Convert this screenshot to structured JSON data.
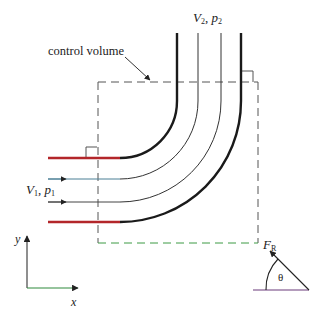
{
  "figure": {
    "labels": {
      "control_volume": "control volume",
      "outlet_velocity": "V",
      "outlet_velocity_sub": "2",
      "outlet_sep": ", ",
      "outlet_pressure": "p",
      "outlet_pressure_sub": "2",
      "inlet_velocity": "V",
      "inlet_velocity_sub": "1",
      "inlet_sep": ", ",
      "inlet_pressure": "p",
      "inlet_pressure_sub": "1",
      "resultant_force": "F",
      "resultant_force_sub": "R",
      "angle": "θ",
      "y_axis": "y",
      "x_axis": "x"
    },
    "colors": {
      "wall": "#1a1a1a",
      "wall_inlet": "#b3262a",
      "streamline": "#333333",
      "streamline_inlet": "#4a7f95",
      "control_volume": "#555555",
      "control_volume_bottom": "#3d9a45",
      "axis_x": "#2f8a3c",
      "force": "#222222",
      "force_base": "#6a3a7a"
    }
  }
}
